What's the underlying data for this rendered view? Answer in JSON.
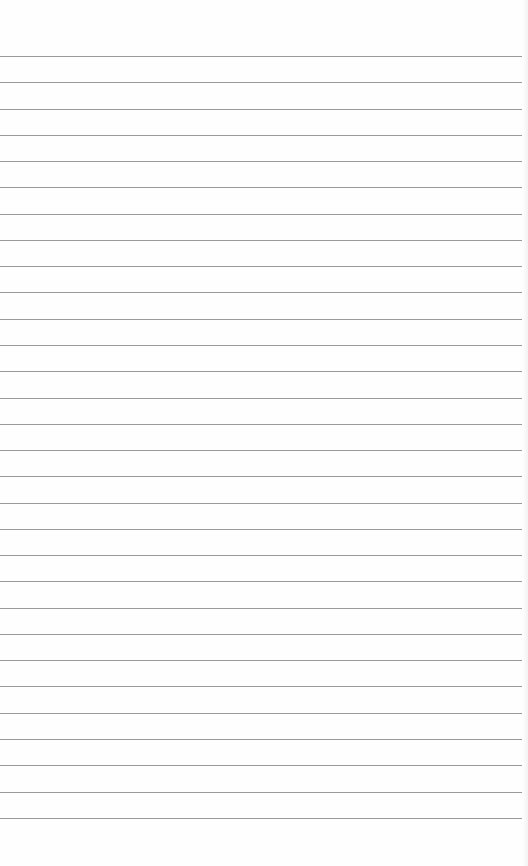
{
  "page": {
    "type": "lined-paper",
    "background_color": "#fefefe",
    "line_color": "#9a9a9a",
    "first_line_y": 56,
    "line_spacing": 26.27,
    "line_count": 30
  }
}
